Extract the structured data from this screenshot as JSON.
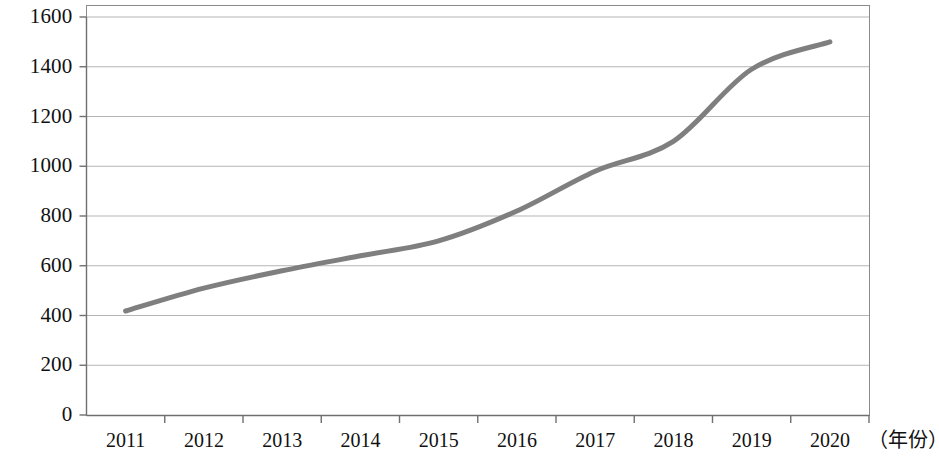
{
  "chart_data": {
    "type": "line",
    "title": "",
    "subtitle": "",
    "xlabel": "（年份）",
    "ylabel": "",
    "categories": [
      "2011",
      "2012",
      "2013",
      "2014",
      "2015",
      "2016",
      "2017",
      "2018",
      "2019",
      "2020"
    ],
    "values": [
      418,
      510,
      580,
      640,
      700,
      820,
      980,
      1100,
      1390,
      1500
    ],
    "series": [
      {
        "name": "",
        "values": [
          418,
          510,
          580,
          640,
          700,
          820,
          980,
          1100,
          1390,
          1500
        ]
      }
    ],
    "ylim": [
      0,
      1600
    ],
    "yticks": [
      "0",
      "200",
      "400",
      "600",
      "800",
      "1000",
      "1200",
      "1400",
      "1600"
    ],
    "ytick_values": [
      0,
      200,
      400,
      600,
      800,
      1000,
      1200,
      1400,
      1600
    ],
    "grid": true,
    "grid_axis": "y",
    "legend": false,
    "legend_position": "none",
    "markers": false,
    "smooth": true,
    "line_color": "#7f7f7f",
    "line_width": 5,
    "grid_color": "#b5b5b5",
    "axis_color": "#7a7a7a",
    "plot_border": true,
    "background_color": "#ffffff"
  },
  "axis": {
    "x_unit_label": "（年份）"
  }
}
